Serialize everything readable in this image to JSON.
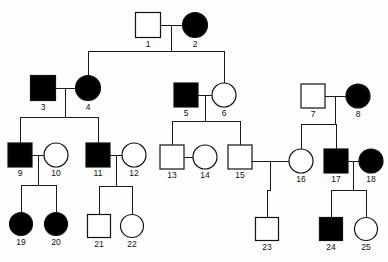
{
  "chart_data": {
    "type": "diagram",
    "subtype": "pedigree",
    "legend": {
      "male_symbol": "square",
      "female_symbol": "circle",
      "affected_fill": "#000000",
      "unaffected_fill": "#ffffff",
      "line_color": "#1a1a1a",
      "background": "#fdfdfd"
    },
    "generations": [
      {
        "name": "I",
        "members": [
          "1",
          "2"
        ]
      },
      {
        "name": "II",
        "members": [
          "3",
          "4",
          "5",
          "6",
          "7",
          "8"
        ]
      },
      {
        "name": "III",
        "members": [
          "9",
          "10",
          "11",
          "12",
          "13",
          "14",
          "15",
          "16",
          "17",
          "18"
        ]
      },
      {
        "name": "IV",
        "members": [
          "19",
          "20",
          "21",
          "22",
          "23",
          "24",
          "25"
        ]
      }
    ],
    "individuals": [
      {
        "id": "1",
        "label": "1",
        "sex": "male",
        "affected": false,
        "x": 148,
        "y": 25,
        "size": 25
      },
      {
        "id": "2",
        "label": "2",
        "sex": "female",
        "affected": true,
        "x": 195,
        "y": 25,
        "size": 25
      },
      {
        "id": "3",
        "label": "3",
        "sex": "male",
        "affected": true,
        "x": 43,
        "y": 88,
        "size": 25
      },
      {
        "id": "4",
        "label": "4",
        "sex": "female",
        "affected": true,
        "x": 88,
        "y": 88,
        "size": 25
      },
      {
        "id": "5",
        "label": "5",
        "sex": "male",
        "affected": true,
        "x": 186,
        "y": 95,
        "size": 24
      },
      {
        "id": "6",
        "label": "6",
        "sex": "female",
        "affected": false,
        "x": 224,
        "y": 95,
        "size": 24
      },
      {
        "id": "7",
        "label": "7",
        "sex": "male",
        "affected": false,
        "x": 313,
        "y": 96,
        "size": 24
      },
      {
        "id": "8",
        "label": "8",
        "sex": "female",
        "affected": true,
        "x": 358,
        "y": 96,
        "size": 24
      },
      {
        "id": "9",
        "label": "9",
        "sex": "male",
        "affected": true,
        "x": 20,
        "y": 155,
        "size": 24
      },
      {
        "id": "10",
        "label": "10",
        "sex": "female",
        "affected": false,
        "x": 56,
        "y": 155,
        "size": 24
      },
      {
        "id": "11",
        "label": "11",
        "sex": "male",
        "affected": true,
        "x": 98,
        "y": 155,
        "size": 24
      },
      {
        "id": "12",
        "label": "12",
        "sex": "female",
        "affected": false,
        "x": 134,
        "y": 155,
        "size": 24
      },
      {
        "id": "13",
        "label": "13",
        "sex": "male",
        "affected": false,
        "x": 172,
        "y": 157,
        "size": 24
      },
      {
        "id": "14",
        "label": "14",
        "sex": "female",
        "affected": false,
        "x": 205,
        "y": 157,
        "size": 24
      },
      {
        "id": "15",
        "label": "15",
        "sex": "male",
        "affected": false,
        "x": 240,
        "y": 157,
        "size": 24
      },
      {
        "id": "16",
        "label": "16",
        "sex": "female",
        "affected": false,
        "x": 301,
        "y": 161,
        "size": 24
      },
      {
        "id": "17",
        "label": "17",
        "sex": "male",
        "affected": true,
        "x": 336,
        "y": 161,
        "size": 24
      },
      {
        "id": "18",
        "label": "18",
        "sex": "female",
        "affected": true,
        "x": 371,
        "y": 161,
        "size": 24
      },
      {
        "id": "19",
        "label": "19",
        "sex": "female",
        "affected": true,
        "x": 21,
        "y": 224,
        "size": 23
      },
      {
        "id": "20",
        "label": "20",
        "sex": "female",
        "affected": true,
        "x": 56,
        "y": 224,
        "size": 23
      },
      {
        "id": "21",
        "label": "21",
        "sex": "male",
        "affected": false,
        "x": 99,
        "y": 226,
        "size": 23
      },
      {
        "id": "22",
        "label": "22",
        "sex": "female",
        "affected": false,
        "x": 132,
        "y": 226,
        "size": 23
      },
      {
        "id": "23",
        "label": "23",
        "sex": "male",
        "affected": false,
        "x": 267,
        "y": 229,
        "size": 23
      },
      {
        "id": "24",
        "label": "24",
        "sex": "male",
        "affected": true,
        "x": 331,
        "y": 229,
        "size": 23
      },
      {
        "id": "25",
        "label": "25",
        "sex": "female",
        "affected": false,
        "x": 366,
        "y": 229,
        "size": 23
      }
    ],
    "matings": [
      {
        "id": "m1",
        "partners": [
          "1",
          "2"
        ],
        "children": [
          "4",
          "6"
        ]
      },
      {
        "id": "m2",
        "partners": [
          "3",
          "4"
        ],
        "children": [
          "9",
          "11"
        ]
      },
      {
        "id": "m3",
        "partners": [
          "5",
          "6"
        ],
        "children": [
          "13",
          "15"
        ]
      },
      {
        "id": "m4",
        "partners": [
          "7",
          "8"
        ],
        "children": [
          "16",
          "17"
        ]
      },
      {
        "id": "m5",
        "partners": [
          "9",
          "10"
        ],
        "children": [
          "19",
          "20"
        ]
      },
      {
        "id": "m6",
        "partners": [
          "11",
          "12"
        ],
        "children": [
          "21",
          "22"
        ]
      },
      {
        "id": "m7",
        "partners": [
          "13",
          "14"
        ],
        "children": []
      },
      {
        "id": "m8",
        "partners": [
          "15",
          "16"
        ],
        "children": [
          "23"
        ]
      },
      {
        "id": "m9",
        "partners": [
          "17",
          "18"
        ],
        "children": [
          "24",
          "25"
        ]
      }
    ]
  }
}
